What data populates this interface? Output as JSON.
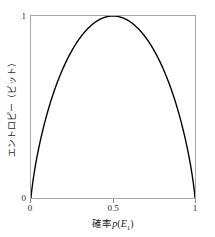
{
  "chart_data": {
    "type": "line",
    "title": "",
    "subtitle": "",
    "xlabel_jp": "確率",
    "xlabel_math": "p",
    "xlabel_open_paren": "(",
    "xlabel_var": "E",
    "xlabel_sub": "1",
    "xlabel_close_paren": ")",
    "xlabel_full": "確率 p(E1)",
    "ylabel": "エントロピー（ビット）",
    "x": [
      0,
      0.01,
      0.02,
      0.03,
      0.04,
      0.05,
      0.06,
      0.08,
      0.1,
      0.12,
      0.15,
      0.18,
      0.2,
      0.25,
      0.3,
      0.35,
      0.4,
      0.45,
      0.5,
      0.55,
      0.6,
      0.65,
      0.7,
      0.75,
      0.8,
      0.82,
      0.85,
      0.88,
      0.9,
      0.92,
      0.94,
      0.95,
      0.96,
      0.97,
      0.98,
      0.99,
      1
    ],
    "values": [
      0,
      0.0808,
      0.1414,
      0.1944,
      0.2423,
      0.2864,
      0.3274,
      0.4022,
      0.469,
      0.5294,
      0.6098,
      0.6801,
      0.7219,
      0.8113,
      0.8813,
      0.9341,
      0.971,
      0.9928,
      1,
      0.9928,
      0.971,
      0.9341,
      0.8813,
      0.8113,
      0.7219,
      0.6801,
      0.6098,
      0.5294,
      0.469,
      0.4022,
      0.3274,
      0.2864,
      0.2423,
      0.1944,
      0.1414,
      0.0808,
      0
    ],
    "formula": "H(p) = -p*log2(p) - (1-p)*log2(1-p)",
    "xlim": [
      0,
      1
    ],
    "ylim": [
      0,
      1
    ],
    "xticks": [
      0,
      0.5,
      1
    ],
    "xticklabels": [
      "0",
      "0.5",
      "1"
    ],
    "yticks": [
      0,
      1
    ],
    "yticklabels": [
      "0",
      "1"
    ],
    "grid": false,
    "legend": null,
    "series_color": "#000000",
    "frame_color": "#a8a8a8",
    "background_color": "#ffffff"
  }
}
